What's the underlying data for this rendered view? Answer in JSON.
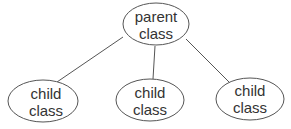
{
  "diagram": {
    "type": "class-hierarchy",
    "nodes": [
      {
        "id": "parent",
        "line1": "parent",
        "line2": "class"
      },
      {
        "id": "child1",
        "line1": "child",
        "line2": "class"
      },
      {
        "id": "child2",
        "line1": "child",
        "line2": "class"
      },
      {
        "id": "child3",
        "line1": "child",
        "line2": "class"
      }
    ],
    "edges": [
      {
        "from": "parent",
        "to": "child1"
      },
      {
        "from": "parent",
        "to": "child2"
      },
      {
        "from": "parent",
        "to": "child3"
      }
    ],
    "colors": {
      "stroke": "#555555",
      "text": "#333333",
      "background": "#ffffff"
    }
  }
}
